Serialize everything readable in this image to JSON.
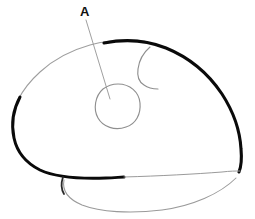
{
  "figure": {
    "background_color": "#ffffff",
    "width": 255,
    "height": 219,
    "labels": [
      {
        "id": "A",
        "text": "A",
        "x": 86,
        "y": 12,
        "color": "#111111",
        "bold": true,
        "font_size": 13
      }
    ],
    "leader_line": {
      "name": "leader-line-a",
      "from": [
        86,
        20
      ],
      "to": [
        110,
        99
      ],
      "color": "#9a9a9a",
      "width": 0.9
    },
    "strokes": [
      {
        "name": "main-outline-thick",
        "description": "Heavy black outer contour of the body sweeping from upper middle around left, bottom left and down the right side",
        "color": "#0a0a0a",
        "width": 3.0
      },
      {
        "name": "main-outline-thin-upper-left",
        "description": "Faint grey continuation of the upper-left contour",
        "color": "#9e9e9e",
        "width": 1.0
      },
      {
        "name": "inner-oval",
        "description": "Small irregular oval marked by label A",
        "color": "#8f8f8f",
        "width": 1.1,
        "center": [
          118,
          106
        ],
        "radius_x": 22,
        "radius_y": 22
      },
      {
        "name": "inner-hook-curve",
        "description": "Thin S-shaped curve in the upper right interior",
        "color": "#8f8f8f",
        "width": 1.1
      },
      {
        "name": "lower-flap-curve",
        "description": "Thin grey curve forming the lower flap beneath the main body",
        "color": "#9a9a9a",
        "width": 1.0
      },
      {
        "name": "lower-flap-hook",
        "description": "Short dark hook at the left end of the lower flap",
        "color": "#2a2a2a",
        "width": 1.6
      }
    ]
  }
}
